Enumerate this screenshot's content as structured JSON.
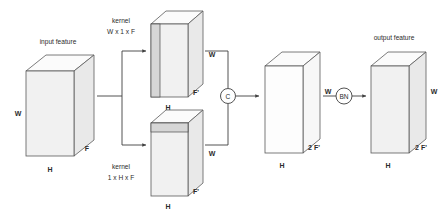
{
  "diagram": {
    "title_input": "input feature",
    "title_output": "output feature",
    "kernel_top_line1": "kernel",
    "kernel_top_line2": "W x 1 x F",
    "kernel_bottom_line1": "kernel",
    "kernel_bottom_line2": "1 x H x F",
    "node_concat": "C",
    "node_bn": "BN",
    "colors": {
      "face": "#f1f1f1",
      "face_open": "#fdfdfd",
      "side": "#e9e9e9",
      "top": "#fbfbfb",
      "stripe": "#d6d6d6",
      "outline": "#5a5a5a",
      "wire": "#3f3f3f",
      "text": "#2b2b2b",
      "background": "#ffffff"
    },
    "cubes": [
      {
        "id": "input-feature-cube",
        "label_width": "W",
        "label_depth": "F",
        "label_height": "H",
        "shaded": true,
        "stripe": "none"
      },
      {
        "id": "kernel-top-output-cube",
        "label_width": "W",
        "label_depth": "F'",
        "label_height": "H",
        "shaded": true,
        "stripe": "vertical-left"
      },
      {
        "id": "kernel-bottom-output-cube",
        "label_width": "W",
        "label_depth": "F'",
        "label_height": "H",
        "shaded": true,
        "stripe": "horizontal-top"
      },
      {
        "id": "concat-cube",
        "label_width": "W",
        "label_depth": "2 F'",
        "label_height": "H",
        "shaded": false,
        "stripe": "none"
      },
      {
        "id": "output-feature-cube",
        "label_width": "W",
        "label_depth": "2 F'",
        "label_height": "H",
        "shaded": true,
        "stripe": "none"
      }
    ]
  }
}
